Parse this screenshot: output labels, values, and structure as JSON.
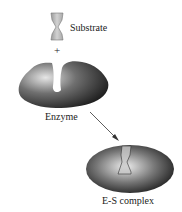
{
  "diagram": {
    "substrate_label": "Substrate",
    "plus": "+",
    "enzyme_label": "Enzyme",
    "complex_label": "E-S complex"
  },
  "colors": {
    "enzyme_dark": "#2a2a2a",
    "enzyme_light": "#d8d8d8",
    "substrate": "#bdbdbd",
    "background": "#ffffff"
  }
}
